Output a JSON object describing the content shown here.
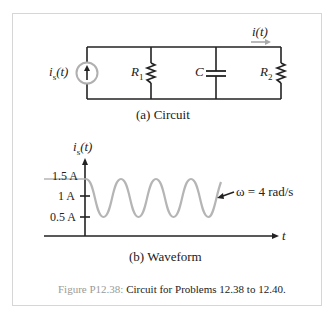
{
  "circuit": {
    "source_label": "i",
    "source_sub": "s",
    "source_arg": "(t)",
    "r1_label": "R",
    "r1_sub": "1",
    "c_label": "C",
    "r2_label": "R",
    "r2_sub": "2",
    "current_label": "i(t)",
    "caption": "(a)  Circuit"
  },
  "waveform": {
    "y_axis_label": "i",
    "y_axis_sub": "s",
    "y_axis_arg": "(t)",
    "x_axis_label": "t",
    "ticks": [
      "1.5 A",
      "1 A",
      "0.5 A"
    ],
    "annotation": "ω = 4 rad/s",
    "caption": "(b)  Waveform"
  },
  "figure_caption": {
    "number": "Figure P12.38:",
    "text": " Circuit for Problems 12.38 to 12.40."
  },
  "colors": {
    "wire": "#222222",
    "wave": "#b5b5b5",
    "source_circle": "#b0b0b0",
    "arrow": "#a8a8a8"
  }
}
